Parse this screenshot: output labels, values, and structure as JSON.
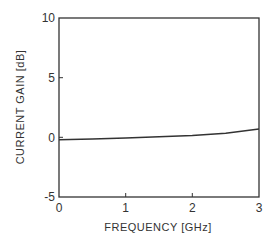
{
  "chart_data": {
    "type": "line",
    "title": "",
    "xlabel": "FREQUENCY [GHz]",
    "ylabel": "CURRENT GAIN [dB]",
    "xlim": [
      0,
      3
    ],
    "ylim": [
      -5,
      10
    ],
    "x_ticks": [
      "0",
      "1",
      "2",
      "3"
    ],
    "y_ticks": [
      "-5",
      "0",
      "5",
      "10"
    ],
    "grid": false,
    "legend": null,
    "series": [
      {
        "name": "current gain",
        "x": [
          0,
          0.5,
          1.0,
          1.5,
          2.0,
          2.5,
          3.0
        ],
        "y": [
          -0.2,
          -0.15,
          -0.05,
          0.05,
          0.15,
          0.35,
          0.7
        ]
      }
    ],
    "colors": {
      "line": "#333333",
      "frame": "#333333"
    }
  },
  "axes": {
    "xlabel": "FREQUENCY [GHz]",
    "ylabel": "CURRENT GAIN [dB]",
    "xticks": [
      "0",
      "1",
      "2",
      "3"
    ],
    "yticks": [
      "10",
      "5",
      "0",
      "-5"
    ]
  }
}
